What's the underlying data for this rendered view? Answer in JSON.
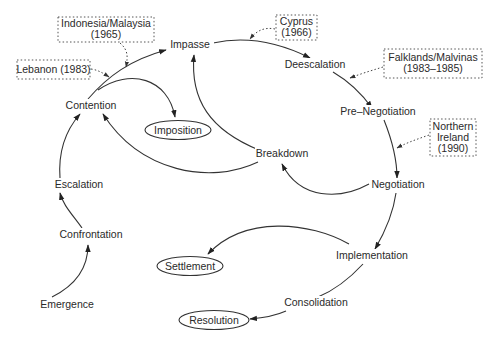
{
  "diagram": {
    "type": "conflict-lifecycle-flow",
    "stages": {
      "impasse": "Impasse",
      "deescalation": "Deescalation",
      "pre_negotiation": "Pre–Negotiation",
      "negotiation": "Negotiation",
      "implementation": "Implementation",
      "consolidation": "Consolidation",
      "breakdown": "Breakdown",
      "contention": "Contention",
      "escalation": "Escalation",
      "confrontation": "Confrontation",
      "emergence": "Emergence"
    },
    "outcomes": {
      "imposition": "Imposition",
      "settlement": "Settlement",
      "resolution": "Resolution"
    },
    "case_annotations": {
      "indonesia": {
        "line1": "Indonesia/Malaysia",
        "line2": "(1965)",
        "points_to": "Contention→Impasse"
      },
      "lebanon": {
        "line1": "Lebanon (1983)",
        "points_to": "Contention→Impasse"
      },
      "cyprus": {
        "line1": "Cyprus",
        "line2": "(1966)",
        "points_to": "Impasse→Deescalation"
      },
      "falklands": {
        "line1": "Falklands/Malvinas",
        "line2": "(1983–1985)",
        "points_to": "Deescalation→Pre-Negotiation"
      },
      "northern_ireland": {
        "line1": "Northern",
        "line2": "Ireland",
        "line3": "(1990)",
        "points_to": "Pre-Negotiation→Negotiation"
      }
    },
    "edges": [
      [
        "Emergence",
        "Confrontation"
      ],
      [
        "Confrontation",
        "Escalation"
      ],
      [
        "Escalation",
        "Contention"
      ],
      [
        "Contention",
        "Impasse"
      ],
      [
        "Contention",
        "Imposition"
      ],
      [
        "Impasse",
        "Deescalation"
      ],
      [
        "Deescalation",
        "Pre-Negotiation"
      ],
      [
        "Pre-Negotiation",
        "Negotiation"
      ],
      [
        "Negotiation",
        "Breakdown"
      ],
      [
        "Breakdown",
        "Impasse"
      ],
      [
        "Breakdown",
        "Contention"
      ],
      [
        "Negotiation",
        "Implementation"
      ],
      [
        "Implementation",
        "Settlement"
      ],
      [
        "Implementation",
        "Consolidation"
      ],
      [
        "Consolidation",
        "Resolution"
      ]
    ],
    "colors": {
      "line": "#333333",
      "text": "#2a2a2a",
      "background": "#ffffff"
    }
  }
}
